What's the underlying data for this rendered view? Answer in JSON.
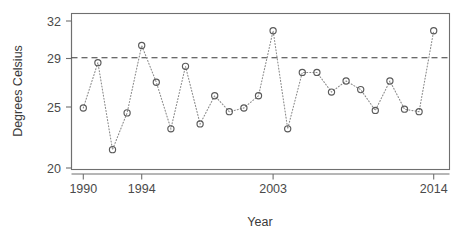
{
  "chart_data": {
    "type": "line",
    "title": "",
    "subtitle": "",
    "xlabel": "Year",
    "ylabel": "Degrees Celsius",
    "x": [
      1990,
      1991,
      1992,
      1993,
      1994,
      1995,
      1996,
      1997,
      1998,
      1999,
      2000,
      2001,
      2002,
      2003,
      2004,
      2005,
      2006,
      2007,
      2008,
      2009,
      2010,
      2011,
      2012,
      2013,
      2014
    ],
    "values": [
      24.9,
      28.6,
      21.5,
      24.5,
      30.0,
      27.0,
      23.2,
      28.3,
      23.6,
      25.9,
      24.6,
      24.9,
      25.9,
      31.2,
      23.2,
      27.8,
      27.8,
      26.2,
      27.1,
      26.4,
      24.7,
      27.1,
      24.8,
      24.6,
      31.2
    ],
    "series": [
      {
        "name": "Annual temperature",
        "values": [
          24.9,
          28.6,
          21.5,
          24.5,
          30.0,
          27.0,
          23.2,
          28.3,
          23.6,
          25.9,
          24.6,
          24.9,
          25.9,
          31.2,
          23.2,
          27.8,
          27.8,
          26.2,
          27.1,
          26.4,
          24.7,
          27.1,
          24.8,
          24.6,
          31.2
        ]
      }
    ],
    "xlim": [
      1989.4,
      2014.6
    ],
    "ylim": [
      19.3,
      32.3
    ],
    "xticks": [
      1990,
      1994,
      2003,
      2014
    ],
    "xtick_labels": [
      "1990",
      "1994",
      "2003",
      "2014"
    ],
    "yticks": [
      20,
      25,
      29,
      32
    ],
    "ytick_labels": [
      "20",
      "25",
      "29",
      "32"
    ],
    "grid": false,
    "legend": "none",
    "annotations": [
      {
        "type": "horizontal-reference-line",
        "value": 29,
        "style": "dashed",
        "color": "#3a3a3a"
      }
    ],
    "marker": "open-circle",
    "line_style": "dotted",
    "colors": {
      "marker": "#5a5a5a",
      "line": "#8c8c8c",
      "reference": "#3a3a3a",
      "axis": "#6f6f6f",
      "text": "#3a3a3a",
      "background": "#ffffff"
    }
  },
  "axes": {
    "y_title": "Degrees Celsius",
    "x_title": "Year"
  }
}
